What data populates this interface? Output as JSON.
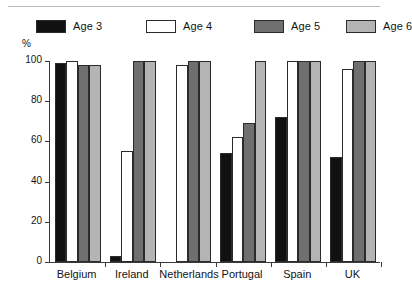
{
  "chart_data": {
    "type": "bar",
    "title": "",
    "xlabel": "",
    "ylabel": "%",
    "ylim": [
      0,
      100
    ],
    "yticks": [
      0,
      20,
      40,
      60,
      80,
      100
    ],
    "grid": false,
    "legend_position": "top",
    "categories": [
      "Belgium",
      "Ireland",
      "Netherlands",
      "Portugal",
      "Spain",
      "UK"
    ],
    "series": [
      {
        "name": "Age 3",
        "color": "#111111",
        "values": [
          99,
          3,
          0,
          54,
          72,
          52
        ]
      },
      {
        "name": "Age 4",
        "color": "#ffffff",
        "values": [
          100,
          55,
          98,
          62,
          100,
          96
        ]
      },
      {
        "name": "Age 5",
        "color": "#706f6f",
        "values": [
          98,
          100,
          100,
          69,
          100,
          100
        ]
      },
      {
        "name": "Age 6",
        "color": "#b5b4b4",
        "values": [
          98,
          100,
          100,
          100,
          100,
          100
        ]
      }
    ]
  },
  "axis": {
    "y_unit": "%",
    "tick_labels": [
      "100",
      "80",
      "60",
      "40",
      "20",
      "0"
    ]
  },
  "legend": {
    "items": [
      {
        "label": "Age 3"
      },
      {
        "label": "Age 4"
      },
      {
        "label": "Age 5"
      },
      {
        "label": "Age 6"
      }
    ]
  }
}
